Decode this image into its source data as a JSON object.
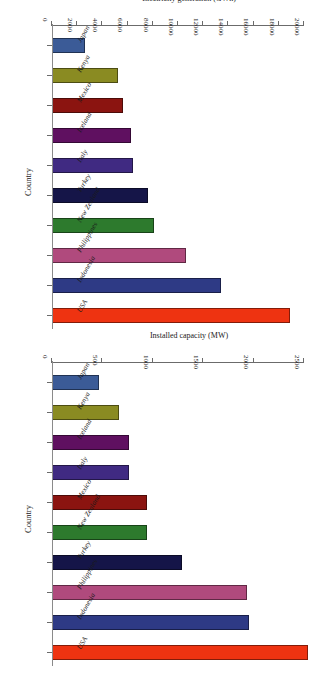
{
  "page": {
    "orientation_deg": 180,
    "background": "#ffffff"
  },
  "charts": {
    "capacity": {
      "title": "",
      "x_axis_title": "Installed capacity (MW)",
      "y_axis_title": "Country",
      "ticks": [
        "0",
        "500",
        "1000",
        "1500",
        "2000",
        "2500"
      ]
    },
    "generation": {
      "title": "",
      "x_axis_title": "Electricity generation (GWh)",
      "y_axis_title": "Country",
      "ticks": [
        "0",
        "2000",
        "4000",
        "6000",
        "8000",
        "10000",
        "12000",
        "14000",
        "16000",
        "18000",
        "20000"
      ]
    }
  },
  "chart_data": [
    {
      "id": "capacity",
      "type": "bar",
      "orientation": "horizontal",
      "title": "",
      "xlabel": "Installed capacity (MW)",
      "ylabel": "Country",
      "xlim": [
        0,
        2500
      ],
      "grid": false,
      "legend": "none",
      "categories": [
        "USA",
        "Indonesia",
        "Philippines",
        "Turkey",
        "New Zealand",
        "Mexico",
        "Italy",
        "Iceland",
        "Kenya",
        "Japan"
      ],
      "values": [
        2540,
        1950,
        1930,
        1290,
        940,
        940,
        765,
        765,
        660,
        465
      ],
      "colors": [
        "#ee3311",
        "#2e3a85",
        "#b04a7d",
        "#151548",
        "#2d7a2d",
        "#8b1410",
        "#402a82",
        "#5f1060",
        "#8a8b22",
        "#3b5b97"
      ]
    },
    {
      "id": "generation",
      "type": "bar",
      "orientation": "horizontal",
      "title": "",
      "xlabel": "Electricity generation (GWh)",
      "ylabel": "Country",
      "xlim": [
        0,
        20000
      ],
      "grid": false,
      "legend": "none",
      "categories": [
        "USA",
        "Indonesia",
        "Philippines",
        "New Zealand",
        "Turkey",
        "Italy",
        "Iceland",
        "Mexico",
        "Kenya",
        "Japan"
      ],
      "values": [
        18900,
        13400,
        10600,
        8100,
        7600,
        6400,
        6250,
        5600,
        5200,
        2650
      ],
      "colors": [
        "#ee3311",
        "#2e3a85",
        "#b04a7d",
        "#2d7a2d",
        "#151548",
        "#402a82",
        "#5f1060",
        "#8b1410",
        "#8a8b22",
        "#3b5b97"
      ]
    }
  ]
}
